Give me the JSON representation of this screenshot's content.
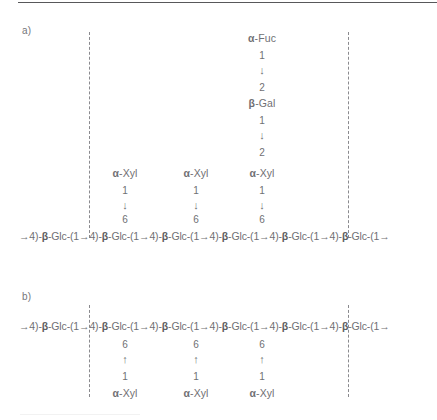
{
  "figure": {
    "panels": [
      {
        "id": "a",
        "label": "a)",
        "backbone": "→4)-β-Glc-(1→4)-β-Glc-(1→4)-β-Glc-(1→4)-β-Glc-(1→4)-β-Glc-(1→4)-β-Glc-(1→",
        "branch_direction": "above",
        "side_chains": [
          {
            "column": 1,
            "residues": [
              "α-Xyl"
            ],
            "stack": [
              "α-Xyl",
              "1",
              "↓",
              "6"
            ]
          },
          {
            "column": 2,
            "residues": [
              "α-Xyl"
            ],
            "stack": [
              "α-Xyl",
              "1",
              "↓",
              "6"
            ]
          },
          {
            "column": 3,
            "residues": [
              "α-Fuc",
              "β-Gal",
              "α-Xyl"
            ],
            "stack": [
              "α-Fuc",
              "1",
              "↓",
              "2",
              "β-Gal",
              "1",
              "↓",
              "2",
              "α-Xyl",
              "1",
              "↓",
              "6"
            ]
          }
        ]
      },
      {
        "id": "b",
        "label": "b)",
        "backbone": "→4)-β-Glc-(1→4)-β-Glc-(1→4)-β-Glc-(1→4)-β-Glc-(1→4)-β-Glc-(1→4)-β-Glc-(1→",
        "branch_direction": "below",
        "side_chains": [
          {
            "column": 1,
            "residues": [
              "α-Xyl"
            ],
            "stack": [
              "6",
              "↑",
              "1",
              "α-Xyl"
            ]
          },
          {
            "column": 2,
            "residues": [
              "α-Xyl"
            ],
            "stack": [
              "6",
              "↑",
              "1",
              "α-Xyl"
            ]
          },
          {
            "column": 3,
            "residues": [
              "α-Xyl"
            ],
            "stack": [
              "6",
              "↑",
              "1",
              "α-Xyl"
            ]
          }
        ]
      }
    ],
    "repeat_bracket": {
      "style": "dashed-vertical",
      "count": 2
    },
    "colors": {
      "text": "#6f6f73",
      "rule": "#58585a",
      "bracket": "#8a8a8e",
      "background": "#ffffff"
    }
  },
  "panel_a": {
    "label": "a)",
    "backbone_prefix": "→4)-",
    "unit": "-Glc-(1→4)-",
    "tail": "-Glc-(1→",
    "beta": "β",
    "col1": {
      "r0": "α-Xyl",
      "r1": "1",
      "r2": "↓",
      "r3": "6"
    },
    "col2": {
      "r0": "α-Xyl",
      "r1": "1",
      "r2": "↓",
      "r3": "6"
    },
    "col3": {
      "r0": "α-Fuc",
      "r1": "1",
      "r2": "↓",
      "r3": "2",
      "r4": "β-Gal",
      "r5": "1",
      "r6": "↓",
      "r7": "2",
      "r8": "α-Xyl",
      "r9": "1",
      "r10": "↓",
      "r11": "6"
    }
  },
  "panel_b": {
    "label": "b)",
    "col1": {
      "r0": "6",
      "r1": "↑",
      "r2": "1",
      "r3": "α-Xyl"
    },
    "col2": {
      "r0": "6",
      "r1": "↑",
      "r2": "1",
      "r3": "α-Xyl"
    },
    "col3": {
      "r0": "6",
      "r1": "↑",
      "r2": "1",
      "r3": "α-Xyl"
    }
  }
}
